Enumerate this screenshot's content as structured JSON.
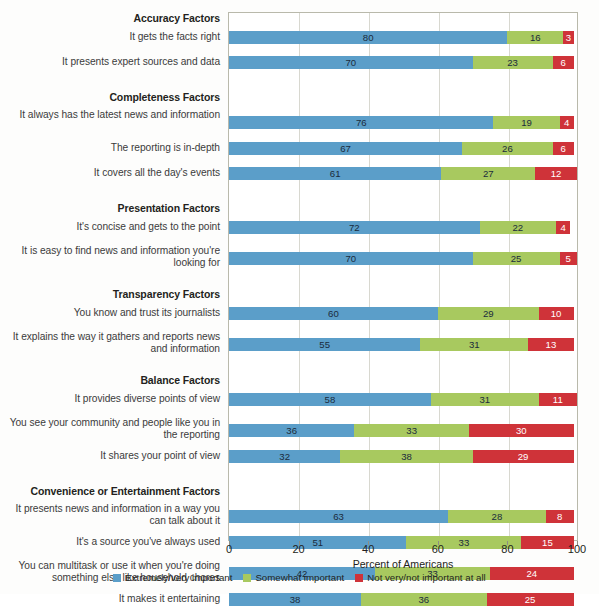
{
  "chart_data": {
    "type": "bar",
    "subtype": "stacked-horizontal-100",
    "title": "",
    "xlabel": "Percent of Americans",
    "ylabel": "",
    "xlim": [
      0,
      100
    ],
    "xticks": [
      0,
      20,
      40,
      60,
      80,
      100
    ],
    "grid": true,
    "legend_position": "bottom",
    "series": [
      {
        "name": "Extremely/very important",
        "color": "#5b9ec9"
      },
      {
        "name": "Somewhat important",
        "color": "#a8c95f"
      },
      {
        "name": "Not very/not important at all",
        "color": "#cf3339"
      }
    ],
    "groups": [
      {
        "header": "Accuracy Factors",
        "rows": [
          {
            "label": "It gets the facts right",
            "values": [
              80,
              16,
              3
            ]
          },
          {
            "label": "It presents expert sources and data",
            "values": [
              70,
              23,
              6
            ]
          }
        ]
      },
      {
        "header": "Completeness Factors",
        "rows": [
          {
            "label": "It always has the latest news and information",
            "values": [
              76,
              19,
              4
            ]
          },
          {
            "label": "The reporting is in-depth",
            "values": [
              67,
              26,
              6
            ]
          },
          {
            "label": "It covers all the day's events",
            "values": [
              61,
              27,
              12
            ]
          }
        ]
      },
      {
        "header": "Presentation Factors",
        "rows": [
          {
            "label": "It's concise and gets to the point",
            "values": [
              72,
              22,
              4
            ]
          },
          {
            "label": "It is easy to find news and information you're looking for",
            "values": [
              70,
              25,
              5
            ]
          }
        ]
      },
      {
        "header": "Transparency Factors",
        "rows": [
          {
            "label": "You know and trust its journalists",
            "values": [
              60,
              29,
              10
            ]
          },
          {
            "label": "It explains the way it gathers and reports news and information",
            "values": [
              55,
              31,
              13
            ]
          }
        ]
      },
      {
        "header": "Balance Factors",
        "rows": [
          {
            "label": "It provides diverse points of view",
            "values": [
              58,
              31,
              11
            ]
          },
          {
            "label": "You see your community and people like you in the reporting",
            "values": [
              36,
              33,
              30
            ]
          },
          {
            "label": "It shares your point of view",
            "values": [
              32,
              38,
              29
            ]
          }
        ]
      },
      {
        "header": "Convenience or Entertainment Factors",
        "rows": [
          {
            "label": "It presents news and information in a way you can talk about it",
            "values": [
              63,
              28,
              8
            ]
          },
          {
            "label": "It's a source you've always used",
            "values": [
              51,
              33,
              15
            ]
          },
          {
            "label": "You can multitask or use it when you're doing something else like household chores",
            "values": [
              42,
              33,
              24
            ]
          },
          {
            "label": "It makes it entertaining",
            "values": [
              38,
              36,
              25
            ]
          }
        ]
      }
    ]
  }
}
